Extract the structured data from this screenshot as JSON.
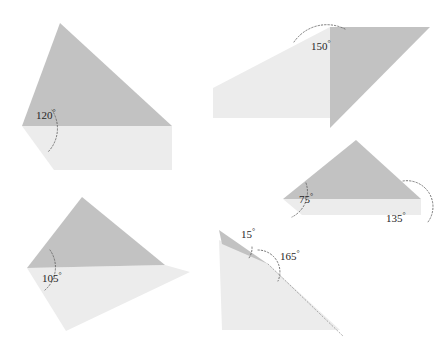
{
  "canvas": {
    "width": 446,
    "height": 350,
    "background": "#ffffff"
  },
  "palette": {
    "dark_fill": "#c2c2c2",
    "light_fill": "#ececec",
    "arc_stroke": "#595959",
    "label_color": "#262626"
  },
  "figures": [
    {
      "id": "figure-120",
      "name": "obtuse-angle-120",
      "label": "120",
      "degree_symbol": "°",
      "label_x": 36,
      "label_y": 119,
      "vertex": {
        "x": 22,
        "y": 126
      },
      "dark_polygon": "60,23 22,126 172,126",
      "light_polygon": "22,126 172,126 172,170 54,170"
    },
    {
      "id": "figure-150",
      "name": "obtuse-angle-150",
      "label": "150",
      "degree_symbol": "°",
      "label_x": 311,
      "label_y": 50,
      "vertex": {
        "x": 330,
        "y": 27
      },
      "dark_polygon": "330,27 430,27 330,128",
      "light_polygon": "330,27 330,118 213,118 213,88"
    },
    {
      "id": "figure-75-135",
      "name": "triangle-angles-75-135",
      "label": "75",
      "degree_symbol": "°",
      "label_x": 299,
      "label_y": 203,
      "vertex": {
        "x": 283,
        "y": 199
      },
      "label2": "135",
      "label2_x": 386,
      "label2_y": 222,
      "vertex2": {
        "x": 421,
        "y": 199
      },
      "dark_polygon": "356,140 283,199 421,199",
      "light_polygon": "283,199 421,199 421,215 302,215"
    },
    {
      "id": "figure-105",
      "name": "obtuse-angle-105",
      "label": "105",
      "degree_symbol": "°",
      "label_x": 42,
      "label_y": 282,
      "vertex": {
        "x": 27,
        "y": 268
      },
      "dark_polygon": "82,197 27,268 165,265",
      "light_polygon": "27,268 165,265 190,272 66,331"
    },
    {
      "id": "figure-15-165",
      "name": "acute-and-reflex-15-165",
      "label": "15",
      "degree_symbol": "°",
      "label_x": 241,
      "label_y": 238,
      "vertex": {
        "x": 268,
        "y": 264
      },
      "label2": "165",
      "label2_x": 280,
      "label2_y": 260,
      "dark_polygon": "219,230 268,264 222,244",
      "light_polygon": "219,240 268,264 340,330 222,330"
    }
  ]
}
